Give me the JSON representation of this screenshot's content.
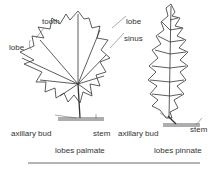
{
  "diagram": {
    "labels": {
      "tooth": "tooth",
      "lobe_left": "lobe",
      "lobe_right": "lobe",
      "sinus": "sinus",
      "axillary_bud_left": "axillary bud",
      "stem_left": "stem",
      "axillary_bud_right": "axillary bud",
      "stem_right": "stem"
    },
    "captions": {
      "palmate": "lobes palmate",
      "pinnate": "lobes pinnate"
    },
    "colors": {
      "line": "#333333",
      "background": "#ffffff"
    }
  }
}
